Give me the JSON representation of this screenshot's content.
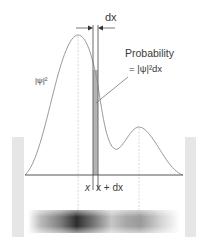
{
  "labels": {
    "dx_top": "dx",
    "probability_line1": "Probability",
    "probability_line2": "= |ψ|²dx",
    "psi_squared": "|ψ|²",
    "x_left": "x",
    "x_right": "x + dx"
  },
  "colors": {
    "curve": "#9a9a9a",
    "baseline": "#555555",
    "strip_fill": "#b3b3b3",
    "strip_edges": "#6a6a6a",
    "walls": "#e6e6e6",
    "dashed_guides": "#cfcfcf",
    "text": "#3a3a3a",
    "density_dark": "#2e2e2e"
  }
}
